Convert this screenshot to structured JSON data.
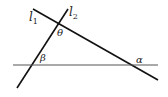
{
  "diagram": {
    "type": "geometry-lines",
    "lines": [
      {
        "id": "l1",
        "label": "l",
        "subscript": "1",
        "x1": 33,
        "y1": 9,
        "x2": 158,
        "y2": 80
      },
      {
        "id": "l2",
        "label": "l",
        "subscript": "2",
        "x1": 68,
        "y1": 9,
        "x2": 17,
        "y2": 88
      },
      {
        "id": "horizontal",
        "label": "",
        "x1": 13,
        "y1": 65,
        "x2": 158,
        "y2": 65
      }
    ],
    "angles": [
      {
        "id": "theta",
        "symbol": "θ",
        "x": 56,
        "y": 36
      },
      {
        "id": "beta",
        "symbol": "β",
        "x": 40,
        "y": 61
      },
      {
        "id": "alpha",
        "symbol": "α",
        "x": 136,
        "y": 63
      }
    ],
    "line_colors": {
      "l1": "#111111",
      "l2": "#111111",
      "horizontal": "#555555"
    }
  }
}
